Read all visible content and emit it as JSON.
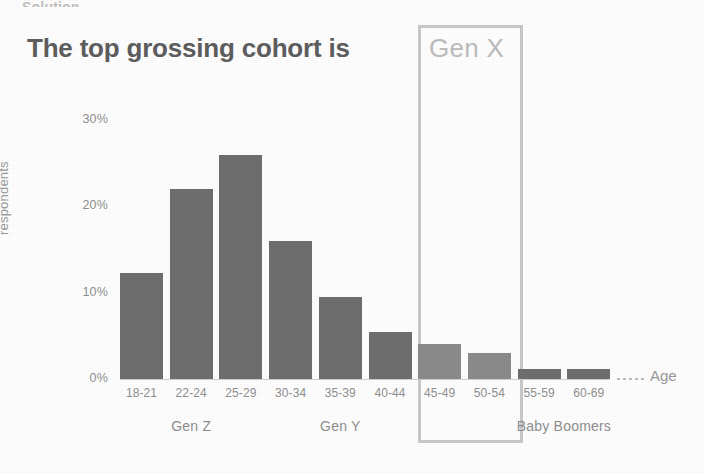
{
  "slide": {
    "cut_off_header": "Solution",
    "headline": "The top grossing cohort is",
    "highlight_label": "Gen X"
  },
  "colors": {
    "bar": "#6f6f6f",
    "bar_highlight": "#8b8b8b",
    "headline_text": "#5e5e5e",
    "highlight_box_border": "#c9c9c9",
    "highlight_label_text": "#bdbdbd",
    "axis_text": "#8f8f8f"
  },
  "chart_data": {
    "type": "bar",
    "title": "The top grossing cohort is Gen X",
    "xlabel": "Age",
    "ylabel": "respondents",
    "categories": [
      "18-21",
      "22-24",
      "25-29",
      "30-34",
      "35-39",
      "40-44",
      "45-49",
      "50-54",
      "55-59",
      "60-69"
    ],
    "values": [
      12.3,
      22.0,
      26.0,
      16.0,
      9.5,
      5.5,
      4.0,
      3.0,
      1.2,
      1.2
    ],
    "ylim": [
      0,
      30
    ],
    "yticks": [
      0,
      10,
      20,
      30
    ],
    "ytick_labels": [
      "0%",
      "10%",
      "20%",
      "30%"
    ],
    "grid": false,
    "legend": "none",
    "groups": [
      {
        "label": "Gen Z",
        "categories": [
          "18-21",
          "22-24",
          "25-29"
        ]
      },
      {
        "label": "Gen Y",
        "categories": [
          "30-34",
          "35-39",
          "40-44"
        ]
      },
      {
        "label": "Gen X",
        "categories": [
          "45-49",
          "50-54"
        ],
        "highlighted": true
      },
      {
        "label": "Baby Boomers",
        "categories": [
          "55-59",
          "60-69"
        ]
      }
    ],
    "annotation": "Gen X cohort highlighted with a box"
  }
}
